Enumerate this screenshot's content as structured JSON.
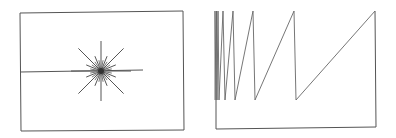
{
  "figures": [
    {
      "id": "starburst",
      "description": "Rectangle with a starburst of radiating line segments and a horizontal line extending to the left edge",
      "ray_count": 16,
      "center_dot": true,
      "line_color": "#555555"
    },
    {
      "id": "sawtooth",
      "description": "Open bracket-shaped frame with a sawtooth line whose teeth widen from left to right",
      "teeth_count": 7,
      "line_color": "#555555"
    }
  ]
}
